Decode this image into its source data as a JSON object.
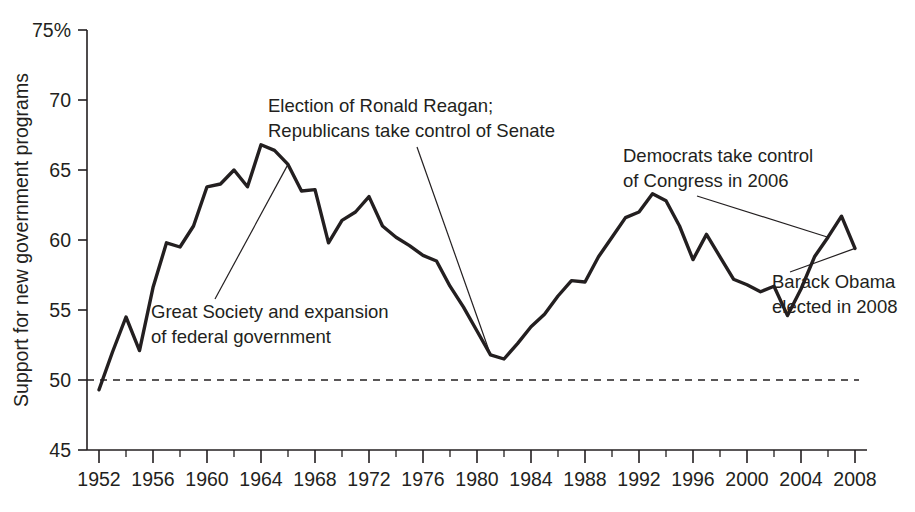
{
  "chart_data": {
    "type": "line",
    "title": "",
    "xlabel": "",
    "ylabel": "Support for new government programs",
    "ylim": [
      45,
      75
    ],
    "xlim": [
      1951,
      2009
    ],
    "grid": false,
    "legend": "none",
    "y_ticks": [
      45,
      50,
      55,
      60,
      65,
      70,
      75
    ],
    "y_tick_labels": [
      "45",
      "50",
      "55",
      "60",
      "65",
      "70",
      "75%"
    ],
    "x_ticks": [
      1952,
      1956,
      1960,
      1964,
      1968,
      1972,
      1976,
      1980,
      1984,
      1988,
      1992,
      1996,
      2000,
      2004,
      2008
    ],
    "x_tick_labels": [
      "1952",
      "1956",
      "1960",
      "1964",
      "1968",
      "1972",
      "1976",
      "1980",
      "1984",
      "1988",
      "1992",
      "1996",
      "2000",
      "2004",
      "2008"
    ],
    "x_minor_tick_step": 2,
    "reference_line": {
      "value": 50,
      "style": "dashed"
    },
    "series": [
      {
        "name": "Support for new government programs",
        "x": [
          1952,
          1953,
          1954,
          1955,
          1956,
          1957,
          1958,
          1959,
          1960,
          1961,
          1962,
          1963,
          1964,
          1965,
          1966,
          1967,
          1968,
          1969,
          1970,
          1971,
          1972,
          1973,
          1974,
          1975,
          1976,
          1977,
          1978,
          1979,
          1980,
          1981,
          1982,
          1983,
          1984,
          1985,
          1986,
          1987,
          1988,
          1989,
          1990,
          1991,
          1992,
          1993,
          1994,
          1995,
          1996,
          1997,
          1998,
          1999,
          2000,
          2001,
          2002,
          2003,
          2004,
          2005,
          2006,
          2007,
          2008
        ],
        "y": [
          49.3,
          52.0,
          54.5,
          52.1,
          56.6,
          59.8,
          59.5,
          61.0,
          63.8,
          64.0,
          65.0,
          63.8,
          66.8,
          66.4,
          65.4,
          63.5,
          63.6,
          59.8,
          61.4,
          62.0,
          63.1,
          61.0,
          60.2,
          59.6,
          58.9,
          58.5,
          56.7,
          55.2,
          53.5,
          51.8,
          51.5,
          52.6,
          53.8,
          54.7,
          56.0,
          57.1,
          57.0,
          58.8,
          60.2,
          61.6,
          62.0,
          63.3,
          62.8,
          61.0,
          58.6,
          60.4,
          58.8,
          57.2,
          56.8,
          56.3,
          56.7,
          54.6,
          56.5,
          58.8,
          60.2,
          61.7,
          59.4
        ]
      }
    ],
    "annotations": [
      {
        "id": "great-society",
        "lines": [
          "Great Society and expansion",
          "of federal government"
        ],
        "points_to_year": 1966,
        "points_to_value": 65.4
      },
      {
        "id": "reagan-election",
        "lines": [
          "Election of Ronald Reagan;",
          "Republicans take control of Senate"
        ],
        "points_to_year": 1981,
        "points_to_value": 51.8
      },
      {
        "id": "democrats-congress",
        "lines": [
          "Democrats take control",
          "of Congress in 2006"
        ],
        "points_to_year": 2006,
        "points_to_value": 60.2
      },
      {
        "id": "obama-elected",
        "lines": [
          "Barack Obama",
          "elected in 2008"
        ],
        "points_to_year": 2008,
        "points_to_value": 59.4
      }
    ]
  }
}
